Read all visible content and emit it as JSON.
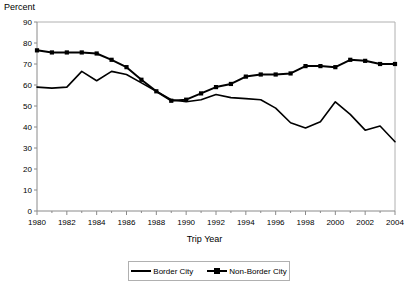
{
  "chart_data": {
    "type": "line",
    "title": "",
    "ylabel": "Percent",
    "xlabel": "Trip Year",
    "ylim": [
      0,
      90
    ],
    "ytick_step": 10,
    "yticks": [
      "0",
      "10",
      "20",
      "30",
      "40",
      "50",
      "60",
      "70",
      "80",
      "90"
    ],
    "xlim": [
      1980,
      2004
    ],
    "grid": false,
    "legend_position": "bottom-center",
    "x": [
      1980,
      1981,
      1982,
      1983,
      1984,
      1985,
      1986,
      1987,
      1988,
      1989,
      1990,
      1991,
      1992,
      1993,
      1994,
      1995,
      1996,
      1997,
      1998,
      1999,
      2000,
      2001,
      2002,
      2003,
      2004
    ],
    "xtick_labels": [
      "1980",
      "1982",
      "1984",
      "1986",
      "1988",
      "1990",
      "1992",
      "1994",
      "1996",
      "1998",
      "2000",
      "2002",
      "2004"
    ],
    "xtick_values": [
      1980,
      1982,
      1984,
      1986,
      1988,
      1990,
      1992,
      1994,
      1996,
      1998,
      2000,
      2002,
      2004
    ],
    "series": [
      {
        "name": "Border City",
        "marker": "none",
        "color": "#000000",
        "values": [
          59.0,
          58.5,
          59.0,
          66.5,
          62.0,
          66.5,
          65.0,
          61.0,
          57.0,
          53.0,
          52.0,
          53.0,
          55.5,
          54.0,
          53.5,
          53.0,
          49.0,
          42.0,
          39.5,
          42.5,
          52.0,
          46.0,
          38.5,
          40.5,
          33.0
        ]
      },
      {
        "name": "Non-Border City",
        "marker": "square",
        "color": "#000000",
        "values": [
          76.5,
          75.5,
          75.5,
          75.5,
          75.0,
          72.0,
          68.5,
          62.5,
          57.0,
          52.5,
          53.0,
          56.0,
          59.0,
          60.5,
          64.0,
          65.0,
          65.0,
          65.5,
          69.0,
          69.0,
          68.5,
          72.0,
          71.5,
          70.0,
          70.0
        ]
      }
    ]
  },
  "axes": {
    "ylabel_text": "Percent",
    "xlabel_text": "Trip Year"
  },
  "legend": {
    "items": [
      {
        "label": "Border City"
      },
      {
        "label": "Non-Border City"
      }
    ]
  },
  "colors": {
    "line": "#000000",
    "frame": "#b0b0b0",
    "text": "#000000"
  }
}
